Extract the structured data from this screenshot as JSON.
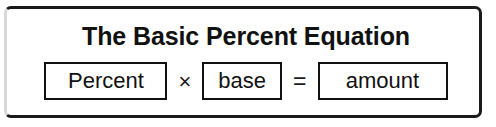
{
  "figure": {
    "title": "The Basic Percent Equation",
    "equation": {
      "terms": [
        {
          "label": "Percent",
          "role": "percent"
        },
        {
          "label": "base",
          "role": "base"
        },
        {
          "label": "amount",
          "role": "amount"
        }
      ],
      "operators": [
        {
          "symbol": "×",
          "name": "multiplication-sign"
        },
        {
          "symbol": "=",
          "name": "equals-sign"
        }
      ]
    },
    "colors": {
      "ink": "#111111",
      "frame_border": "#1a1a1a",
      "frame_border_faded": "#d8d8d8",
      "background": "#ffffff"
    }
  }
}
